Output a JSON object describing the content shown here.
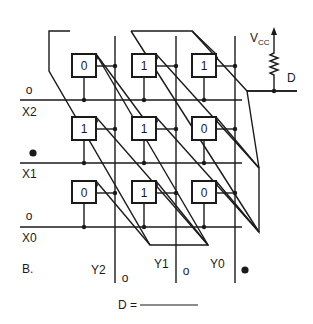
{
  "figure": {
    "label": "B.",
    "vcc_label": "V",
    "vcc_sub": "CC",
    "output_label": "D",
    "answer_prompt": "D =",
    "answer_blank": ""
  },
  "rows": [
    {
      "name": "X2",
      "state": "o",
      "state_type": "open"
    },
    {
      "name": "X1",
      "state": "●",
      "state_type": "filled"
    },
    {
      "name": "X0",
      "state": "o",
      "state_type": "open"
    }
  ],
  "columns": [
    {
      "name": "Y2",
      "state": "o",
      "state_type": "open"
    },
    {
      "name": "Y1",
      "state": "o",
      "state_type": "open"
    },
    {
      "name": "Y0",
      "state": "●",
      "state_type": "filled"
    }
  ],
  "cells": [
    [
      "0",
      "1",
      "1"
    ],
    [
      "1",
      "1",
      "0"
    ],
    [
      "0",
      "1",
      "0"
    ]
  ],
  "colors": {
    "ink": "#1a1a1a",
    "background": "#ffffff"
  }
}
